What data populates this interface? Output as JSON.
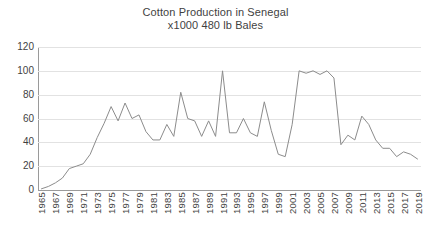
{
  "chart_data": {
    "type": "line",
    "title": "Cotton Production in Senegal",
    "subtitle": "x1000 480 lb Bales",
    "xlabel": "",
    "ylabel": "",
    "ylim": [
      0,
      120
    ],
    "ytick_step": 20,
    "yticks": [
      0,
      20,
      40,
      60,
      80,
      100,
      120
    ],
    "ytick_labels": [
      "0",
      "20",
      "40",
      "60",
      "80",
      "100",
      "120"
    ],
    "grid": true,
    "legend": false,
    "legend_position": "none",
    "line_color": "#8c8c8c",
    "x": [
      1965,
      1966,
      1967,
      1968,
      1969,
      1970,
      1971,
      1972,
      1973,
      1974,
      1975,
      1976,
      1977,
      1978,
      1979,
      1980,
      1981,
      1982,
      1983,
      1984,
      1985,
      1986,
      1987,
      1988,
      1989,
      1990,
      1991,
      1992,
      1993,
      1994,
      1995,
      1996,
      1997,
      1998,
      1999,
      2000,
      2001,
      2002,
      2003,
      2004,
      2005,
      2006,
      2007,
      2008,
      2009,
      2010,
      2011,
      2012,
      2013,
      2014,
      2015,
      2016,
      2017,
      2018,
      2019
    ],
    "xtick_labels": [
      "1965",
      "1967",
      "1969",
      "1971",
      "1973",
      "1975",
      "1977",
      "1979",
      "1981",
      "1983",
      "1985",
      "1987",
      "1989",
      "1991",
      "1993",
      "1995",
      "1997",
      "1999",
      "2001",
      "2003",
      "2005",
      "2007",
      "2009",
      "2011",
      "2013",
      "2015",
      "2017",
      "2019"
    ],
    "values": [
      1,
      3,
      6,
      10,
      18,
      20,
      22,
      30,
      44,
      56,
      70,
      58,
      73,
      60,
      63,
      49,
      42,
      42,
      55,
      45,
      82,
      60,
      58,
      45,
      58,
      45,
      100,
      48,
      48,
      60,
      48,
      45,
      74,
      50,
      30,
      28,
      55,
      100,
      98,
      100,
      97,
      100,
      94,
      38,
      46,
      42,
      62,
      55,
      42,
      35,
      35,
      28,
      32,
      30,
      26
    ],
    "series": [
      {
        "name": "Cotton Production",
        "values": [
          1,
          3,
          6,
          10,
          18,
          20,
          22,
          30,
          44,
          56,
          70,
          58,
          73,
          60,
          63,
          49,
          42,
          42,
          55,
          45,
          82,
          60,
          58,
          45,
          58,
          45,
          100,
          48,
          48,
          60,
          48,
          45,
          74,
          50,
          30,
          28,
          55,
          100,
          98,
          100,
          97,
          100,
          94,
          38,
          46,
          42,
          62,
          55,
          42,
          35,
          35,
          28,
          32,
          30,
          26
        ]
      }
    ]
  }
}
